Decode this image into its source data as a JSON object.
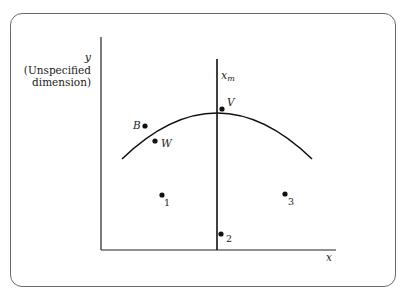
{
  "diagram": {
    "y_axis": {
      "label_var": "y",
      "label_line1": "(Unspecified",
      "label_line2": "dimension)"
    },
    "x_axis": {
      "label": "x"
    },
    "median_line": {
      "label": "x",
      "subscript": "m"
    },
    "curve": {
      "description": "concave-down arc peaking at median line"
    },
    "points": [
      {
        "id": "B",
        "label": "B",
        "x": 145,
        "y": 126,
        "label_side": "left"
      },
      {
        "id": "W",
        "label": "W",
        "x": 155,
        "y": 141,
        "label_side": "right"
      },
      {
        "id": "V",
        "label": "V",
        "x": 222,
        "y": 109,
        "label_side": "right"
      },
      {
        "id": "1",
        "label": "1",
        "x": 162,
        "y": 195,
        "label_side": "right"
      },
      {
        "id": "2",
        "label": "2",
        "x": 221,
        "y": 234,
        "label_side": "right"
      },
      {
        "id": "3",
        "label": "3",
        "x": 285,
        "y": 194,
        "label_side": "right"
      }
    ],
    "colors": {
      "ink": "#111111",
      "frame": "#6a6a6a"
    }
  }
}
